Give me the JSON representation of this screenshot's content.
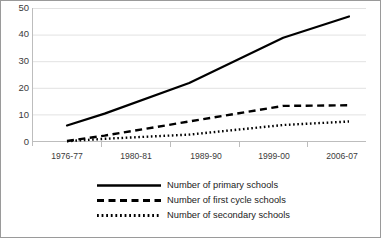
{
  "chart_data": {
    "type": "line",
    "title": "",
    "xlabel": "",
    "ylabel": "",
    "ylim": [
      0,
      50
    ],
    "yticks": [
      0,
      10,
      20,
      30,
      40,
      50
    ],
    "grid": true,
    "legend_position": "bottom",
    "categories": [
      "1976-77",
      "1980-81",
      "1989-90",
      "1999-00",
      "2006-07"
    ],
    "x_years": [
      1976,
      1980,
      1989,
      1999,
      2006
    ],
    "series": [
      {
        "name": "Number of primary schools",
        "style": "solid",
        "color": "#000000",
        "values": [
          6,
          10.5,
          22,
          39,
          47
        ]
      },
      {
        "name": "Number of first cycle schools",
        "style": "dashed",
        "color": "#000000",
        "values": [
          0.2,
          2.2,
          7.5,
          13.4,
          13.6
        ]
      },
      {
        "name": "Number of secondary schools",
        "style": "dotted",
        "color": "#000000",
        "values": [
          0.1,
          1.0,
          2.6,
          6.2,
          7.5
        ]
      }
    ]
  },
  "axis": {
    "y_tick_labels": [
      "50",
      "40",
      "30",
      "20",
      "10",
      "0"
    ],
    "x_tick_labels": [
      "1976-77",
      "1980-81",
      "1989-90",
      "1999-00",
      "2006-07"
    ]
  },
  "legend": {
    "items": [
      {
        "label": "Number of primary schools",
        "style": "solid"
      },
      {
        "label": "Number of first cycle schools",
        "style": "dashed"
      },
      {
        "label": "Number of secondary schools",
        "style": "dotted"
      }
    ]
  },
  "colors": {
    "line": "#000000",
    "grid": "#e2e2e2",
    "axis": "#bdbdbd",
    "border": "#9a9a9a",
    "text": "#3b3b3b",
    "background": "#ffffff"
  }
}
